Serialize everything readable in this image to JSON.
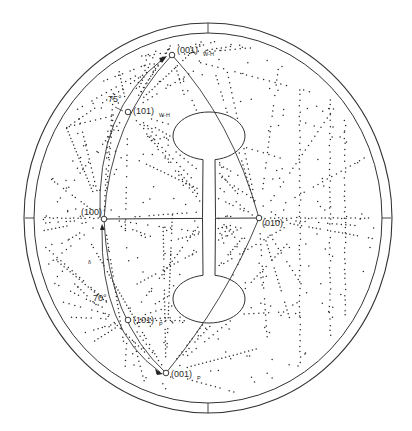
{
  "figure": {
    "type": "stereographic-projection",
    "colors": {
      "background": "#ffffff",
      "line": "#333333",
      "dot": "#2a2a2a"
    },
    "center": [
      208,
      218
    ],
    "outer_circle": {
      "rx": 184,
      "ry": 195
    },
    "inner_circle": {
      "rx": 174,
      "ry": 185
    },
    "axis_ticks": [
      "top",
      "bottom",
      "left",
      "right"
    ]
  },
  "poles": [
    {
      "id": "p001_wh",
      "label": "(001)",
      "subscript": "W-H",
      "x": 172,
      "y": 55,
      "lx": 177,
      "ly": 53
    },
    {
      "id": "p101_wh",
      "label": "(101)",
      "subscript": "W-H",
      "x": 128,
      "y": 112,
      "lx": 133,
      "ly": 114
    },
    {
      "id": "p100",
      "label": "(100)",
      "subscript": "",
      "x": 104,
      "y": 219,
      "lx": 81,
      "ly": 215
    },
    {
      "id": "p010",
      "label": "(010)",
      "subscript": "",
      "x": 259,
      "y": 218,
      "lx": 262,
      "ly": 226
    },
    {
      "id": "p101_p",
      "label": "(101)",
      "subscript": "P",
      "x": 128,
      "y": 320,
      "lx": 133,
      "ly": 323
    },
    {
      "id": "p001_p",
      "label": "(001)",
      "subscript": "P",
      "x": 166,
      "y": 373,
      "lx": 171,
      "ly": 377
    }
  ],
  "angles": [
    {
      "id": "angle_75",
      "text": "75°",
      "x": 108,
      "y": 102
    },
    {
      "id": "angle_70",
      "text": "70°",
      "x": 93,
      "y": 301
    }
  ],
  "minor_marks": [
    {
      "id": "mark_small",
      "text": "δ",
      "x": 88,
      "y": 264
    }
  ],
  "dumbbell": {
    "upper_ellipse": {
      "cx": 209,
      "cy": 136,
      "rx": 36,
      "ry": 24
    },
    "lower_ellipse": {
      "cx": 209,
      "cy": 299,
      "rx": 36,
      "ry": 24
    },
    "stem": {
      "x1": 203,
      "x2": 215,
      "y1": 159,
      "y2": 276
    }
  },
  "zone_dot_seed": 7
}
